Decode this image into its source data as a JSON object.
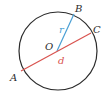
{
  "diagram": {
    "colors": {
      "circle": "#2b2b2b",
      "radius": "#4a9fd4",
      "diameter": "#d9534f",
      "label": "#2b2b2b",
      "diameter_label": "#d9534f",
      "radius_label": "#4a9fd4"
    },
    "points": {
      "A": "A",
      "B": "B",
      "C": "C",
      "O": "O"
    },
    "segments": {
      "radius": "r",
      "diameter": "d"
    }
  }
}
